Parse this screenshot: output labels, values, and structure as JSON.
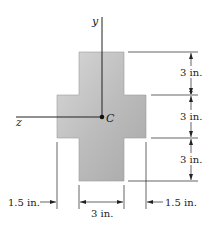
{
  "figure": {
    "axes": {
      "y_label": "y",
      "z_label": "z",
      "centroid_label": "C"
    },
    "dimensions": {
      "right_top": "3 in.",
      "right_middle": "3 in.",
      "right_bottom": "3 in.",
      "bottom_left": "1.5 in.",
      "bottom_center": "3 in.",
      "bottom_right": "1.5 in."
    },
    "colors": {
      "fill_light": "#d4d4d4",
      "fill_dark": "#a9a9a9",
      "line": "#222222"
    }
  }
}
